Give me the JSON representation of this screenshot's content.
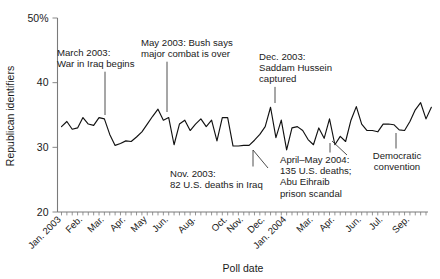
{
  "chart_data": {
    "type": "line",
    "title": "",
    "xlabel": "Poll date",
    "ylabel": "Republican identifiers",
    "ylim": [
      20,
      50
    ],
    "yticks": [
      20,
      30,
      40,
      50
    ],
    "ytick_labels": [
      "20",
      "30",
      "40",
      "50%"
    ],
    "grid": false,
    "legend": "none",
    "xlabels": [
      "Jan. 2003",
      "Feb.",
      "Mar.",
      "Apr.",
      "May",
      "Jun.",
      "Aug.",
      "Oct.",
      "Nov.",
      "Dec.",
      "Jan. 2004",
      "Mar.",
      "Apr.",
      "Jun.",
      "Jul.",
      "Sep."
    ],
    "xtick_positions": [
      0,
      4,
      8,
      12,
      16,
      20,
      25,
      31,
      34,
      38,
      42,
      47,
      51,
      56,
      60,
      65
    ],
    "x_count": 69,
    "series": [
      {
        "name": "Republican identifiers",
        "values": [
          33.2,
          34.0,
          32.8,
          33.0,
          34.6,
          33.6,
          33.4,
          34.6,
          34.4,
          32.0,
          30.3,
          30.6,
          31.0,
          30.9,
          31.6,
          32.4,
          33.6,
          34.8,
          35.9,
          34.2,
          34.6,
          30.4,
          33.6,
          34.2,
          32.6,
          33.6,
          34.4,
          33.2,
          34.2,
          31.0,
          34.6,
          34.6,
          30.2,
          30.2,
          30.3,
          30.3,
          31.1,
          32.0,
          33.2,
          36.2,
          31.5,
          34.2,
          29.6,
          33.0,
          33.2,
          32.6,
          31.2,
          30.4,
          33.0,
          31.4,
          34.4,
          30.4,
          31.7,
          30.9,
          34.2,
          36.3,
          33.6,
          32.6,
          32.6,
          32.4,
          33.6,
          33.6,
          33.5,
          32.7,
          32.6,
          34.0,
          35.8,
          36.9,
          34.4,
          36.2
        ]
      }
    ],
    "annotations": [
      {
        "id": "march-2003-war",
        "lines": [
          "March 2003:",
          "War in Iraq begins"
        ],
        "anchor_x": 105,
        "anchor_y": 115,
        "text_x": 57,
        "text_y": 56,
        "align": "start",
        "leader": true
      },
      {
        "id": "may-2003-major-combat",
        "lines": [
          "May 2003: Bush says",
          "major combat is over"
        ],
        "anchor_x": 167,
        "anchor_y": 112,
        "text_x": 141,
        "text_y": 46,
        "align": "start",
        "leader": true
      },
      {
        "id": "dec-2003-saddam",
        "lines": [
          "Dec. 2003:",
          "Saddam Hussein",
          "captured"
        ],
        "anchor_x": 275,
        "anchor_y": 103,
        "text_x": 259,
        "text_y": 60,
        "align": "start",
        "leader": true
      },
      {
        "id": "nov-2003-deaths",
        "lines": [
          "Nov. 2003:",
          "82 U.S. deaths in Iraq"
        ],
        "anchor_x": 253,
        "anchor_y": 150,
        "text_x": 170,
        "text_y": 177,
        "align": "start",
        "leader": true
      },
      {
        "id": "april-may-2004",
        "lines": [
          "April–May 2004:",
          "135 U.S. deaths;",
          "Abu Eihraib",
          "prison scandal"
        ],
        "anchor_x": 330,
        "anchor_y": 143,
        "text_x": 280,
        "text_y": 163,
        "align": "start",
        "leader": true
      },
      {
        "id": "democratic-convention",
        "lines": [
          "Democratic",
          "convention"
        ],
        "anchor_x": 396,
        "anchor_y": 133,
        "text_x": 397,
        "text_y": 159,
        "align": "middle",
        "leader": true
      }
    ]
  },
  "axis": {
    "y_title": "Republican identifiers",
    "x_title": "Poll date"
  }
}
